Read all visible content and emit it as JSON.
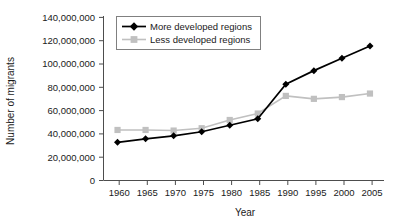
{
  "chart_data": {
    "type": "line",
    "title": "",
    "xlabel": "Year",
    "ylabel": "Number of migrants",
    "x": [
      1960,
      1965,
      1970,
      1975,
      1980,
      1985,
      1990,
      1995,
      2000,
      2005
    ],
    "xtick_labels": [
      "1960",
      "1965",
      "1970",
      "1975",
      "1980",
      "1985",
      "1990",
      "1995",
      "2000",
      "2005"
    ],
    "xlim": [
      1957.5,
      2007.5
    ],
    "ylim": [
      0,
      140000000
    ],
    "ytick_labels": [
      "0",
      "20,000,000",
      "40,000,000",
      "60,000,000",
      "80,000,000",
      "100,000,000",
      "120,000,000",
      "140,000,000"
    ],
    "ytick_values": [
      0,
      20000000,
      40000000,
      60000000,
      80000000,
      100000000,
      120000000,
      140000000
    ],
    "grid": false,
    "legend_position": "top-left-inside",
    "series": [
      {
        "name": "More developed regions",
        "color": "#000000",
        "marker": "diamond",
        "values": [
          32500000,
          35500000,
          38000000,
          41500000,
          47000000,
          52500000,
          82000000,
          93500000,
          104000000,
          114500000
        ]
      },
      {
        "name": "Less developed regions",
        "color": "#c0c0c0",
        "marker": "square",
        "values": [
          43000000,
          43000000,
          42500000,
          44500000,
          51500000,
          57000000,
          72000000,
          69500000,
          71000000,
          74000000
        ]
      }
    ]
  },
  "colors": {
    "axis": "#4d4d4d",
    "text": "#1a1a1a",
    "series_more": "#000000",
    "series_less": "#c0c0c0",
    "legend_border": "#808080",
    "background": "#ffffff"
  }
}
